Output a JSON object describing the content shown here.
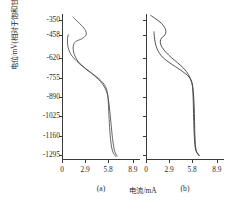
{
  "chart_data": {
    "type": "line",
    "title": "",
    "xlabel": "电流/mA",
    "ylabel": "电位/mV(相对于饱和甘汞电极)",
    "xlim": [
      0,
      9.8
    ],
    "ylim": [
      -310,
      -1330
    ],
    "grid": false,
    "legend": null,
    "x_ticks": [
      "0",
      "2.9",
      "5.8",
      "8.9"
    ],
    "x_tick_values": [
      0,
      2.9,
      5.8,
      8.9
    ],
    "y_ticks": [
      "-1295",
      "-1160",
      "-1025",
      "-890",
      "-755",
      "-620",
      "-458",
      "-350"
    ],
    "y_tick_values": [
      -1295,
      -1160,
      -1025,
      -890,
      -755,
      -620,
      -458,
      -350
    ],
    "panels": [
      {
        "caption": "(a)",
        "series": [
          {
            "name": "forward-scan",
            "points": [
              [
                1.35,
                -330
              ],
              [
                1.9,
                -360
              ],
              [
                2.55,
                -395
              ],
              [
                2.95,
                -425
              ],
              [
                3.05,
                -450
              ],
              [
                2.8,
                -472
              ],
              [
                2.35,
                -487
              ],
              [
                1.9,
                -497
              ],
              [
                1.55,
                -512
              ],
              [
                1.4,
                -540
              ],
              [
                1.45,
                -575
              ],
              [
                1.7,
                -612
              ],
              [
                2.15,
                -650
              ],
              [
                2.95,
                -690
              ],
              [
                4.05,
                -740
              ],
              [
                5.1,
                -800
              ],
              [
                5.7,
                -870
              ],
              [
                5.95,
                -960
              ],
              [
                6.15,
                -1070
              ],
              [
                6.35,
                -1180
              ],
              [
                6.6,
                -1265
              ],
              [
                6.95,
                -1305
              ]
            ]
          },
          {
            "name": "reverse-scan",
            "points": [
              [
                6.8,
                -1308
              ],
              [
                6.35,
                -1268
              ],
              [
                6.1,
                -1185
              ],
              [
                5.95,
                -1075
              ],
              [
                5.85,
                -965
              ],
              [
                5.75,
                -878
              ],
              [
                5.45,
                -815
              ],
              [
                4.7,
                -765
              ],
              [
                3.75,
                -725
              ],
              [
                2.9,
                -690
              ],
              [
                2.2,
                -658
              ],
              [
                1.6,
                -625
              ],
              [
                1.15,
                -595
              ],
              [
                0.85,
                -560
              ],
              [
                0.7,
                -520
              ],
              [
                0.7,
                -480
              ],
              [
                0.8,
                -452
              ]
            ]
          }
        ]
      },
      {
        "caption": "(b)",
        "series": [
          {
            "name": "forward-scan",
            "points": [
              [
                0.55,
                -318
              ],
              [
                1.25,
                -345
              ],
              [
                1.95,
                -375
              ],
              [
                2.35,
                -405
              ],
              [
                2.5,
                -432
              ],
              [
                2.4,
                -455
              ],
              [
                2.1,
                -470
              ],
              [
                1.85,
                -488
              ],
              [
                1.8,
                -512
              ],
              [
                2.05,
                -545
              ],
              [
                2.55,
                -580
              ],
              [
                3.2,
                -615
              ],
              [
                3.95,
                -650
              ],
              [
                4.75,
                -690
              ],
              [
                5.35,
                -735
              ],
              [
                5.75,
                -790
              ],
              [
                5.95,
                -860
              ],
              [
                6.05,
                -950
              ],
              [
                6.1,
                -1060
              ],
              [
                6.15,
                -1170
              ],
              [
                6.3,
                -1262
              ],
              [
                6.75,
                -1300
              ]
            ]
          },
          {
            "name": "reverse-scan",
            "points": [
              [
                6.7,
                -1302
              ],
              [
                6.25,
                -1262
              ],
              [
                6.08,
                -1172
              ],
              [
                6.0,
                -1062
              ],
              [
                5.95,
                -952
              ],
              [
                5.9,
                -862
              ],
              [
                5.8,
                -795
              ],
              [
                5.4,
                -750
              ],
              [
                4.6,
                -712
              ],
              [
                3.7,
                -678
              ],
              [
                2.9,
                -648
              ],
              [
                2.2,
                -618
              ],
              [
                1.7,
                -585
              ],
              [
                1.35,
                -548
              ],
              [
                1.15,
                -508
              ],
              [
                1.05,
                -468
              ],
              [
                1.0,
                -432
              ]
            ]
          }
        ]
      }
    ]
  },
  "axes": {
    "y_title": "电位/mV(相对于饱和甘汞电极)",
    "x_title": "电流/mA"
  },
  "colors": {
    "curve": "#4a4a4a",
    "axis": "#3a3a3a",
    "text": "#2a2a2a",
    "background": "#ffffff"
  }
}
